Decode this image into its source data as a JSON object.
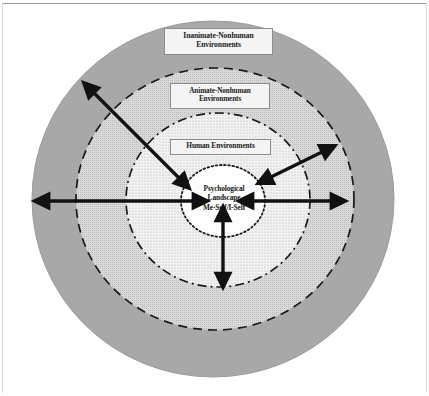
{
  "figure": {
    "type": "concentric-circles-diagram",
    "title_text_present": false,
    "background_color": "#ffffff"
  },
  "rings": [
    {
      "id": "inanimate",
      "name": "Inanimate-Nonhuman Environments",
      "label_line1": "Inanimate-Nonhuman",
      "label_line2": "Environments",
      "fill_color": "#a8a8a8",
      "border_style": "solid",
      "border_color": "#a8a8a8",
      "cx": 213,
      "cy": 199,
      "r": 181
    },
    {
      "id": "animate",
      "name": "Animate-Nonhuman Environments",
      "label_line1": "Animate-Nonhuman",
      "label_line2": "Environments",
      "fill_color": "#c9c9c9",
      "border_style": "dashed",
      "border_color": "#1a1a1a",
      "cx": 213,
      "cy": 199,
      "r": 138
    },
    {
      "id": "human",
      "name": "Human Environments",
      "label_line1": "Human Environments",
      "label_line2": "",
      "fill_color": "#e2e2e2",
      "border_style": "dash-dot",
      "border_color": "#1a1a1a",
      "cx": 213,
      "cy": 199,
      "r": 92
    },
    {
      "id": "psychological-landscape",
      "name": "Psychological Landscape Me-Self/I-Self",
      "label_line1": "Psychological",
      "label_line2": "Landscape",
      "label_line3": "Me-Self/I-Self",
      "fill_color": "#fdfdfd",
      "border_style": "dotted",
      "border_color": "#1a1a1a",
      "cx": 223,
      "cy": 201,
      "r": 41
    }
  ],
  "center": {
    "line1": "Psychological",
    "line2": "Landscape",
    "line3": "Me-Self/I-Self"
  },
  "arrows": [
    {
      "id": "arrow-upper-left-diagonal",
      "name": "double-headed-arrow-upper-left",
      "x1": 94,
      "y1": 93,
      "x2": 179,
      "y2": 178,
      "heads": "both",
      "color": "#111111",
      "width": 3.4
    },
    {
      "id": "arrow-left-horizontal",
      "name": "double-headed-arrow-left",
      "x1": 49,
      "y1": 201,
      "x2": 193,
      "y2": 201,
      "heads": "both",
      "color": "#111111",
      "width": 3.4
    },
    {
      "id": "arrow-right-horizontal",
      "name": "double-headed-arrow-right",
      "x1": 253,
      "y1": 201,
      "x2": 331,
      "y2": 201,
      "heads": "both",
      "color": "#111111",
      "width": 3.4
    },
    {
      "id": "arrow-upper-right-diagonal",
      "name": "double-headed-arrow-upper-right",
      "x1": 271,
      "y1": 177,
      "x2": 322,
      "y2": 152,
      "heads": "both",
      "color": "#111111",
      "width": 3.4
    },
    {
      "id": "arrow-bottom-vertical",
      "name": "double-headed-arrow-bottom",
      "x1": 223,
      "y1": 221,
      "x2": 223,
      "y2": 273,
      "heads": "both",
      "color": "#111111",
      "width": 3.4
    }
  ],
  "colors": {
    "outer_ring_gray": "#a8a8a8",
    "second_ring_gray": "#c9c9c9",
    "third_ring_gray": "#e2e2e2",
    "core_white": "#fdfdfd",
    "stroke_black": "#1a1a1a",
    "label_box_fill": "#f4f4f4",
    "label_box_border": "#8d8d8d",
    "page_background": "#ffffff"
  }
}
